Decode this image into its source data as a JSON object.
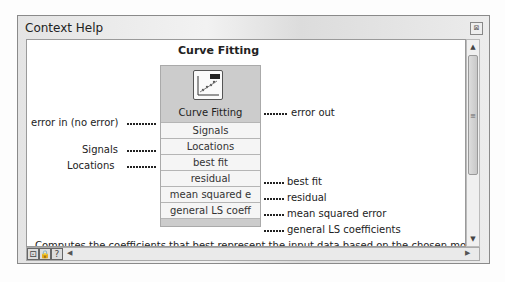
{
  "window": {
    "title": "Context Help"
  },
  "function": {
    "title": "Curve Fitting",
    "node_name": "Curve Fitting",
    "icon": "curve-fitting-icon"
  },
  "inputs": {
    "error_in": "error in (no error)",
    "signals": "Signals",
    "locations": "Locations"
  },
  "rows": [
    "Signals",
    "Locations",
    "best fit",
    "residual",
    "mean squared e",
    "general LS coeff"
  ],
  "outputs": {
    "error_out": "error out",
    "best_fit": "best fit",
    "residual": "residual",
    "mean_squared_error": "mean squared error",
    "general_ls": "general LS coefficients"
  },
  "description": "Computes the coefficients that best represent the input data based on the chosen model type.",
  "toolbar": {
    "btn1": "⊡",
    "btn2": "🔒",
    "help": "?"
  }
}
